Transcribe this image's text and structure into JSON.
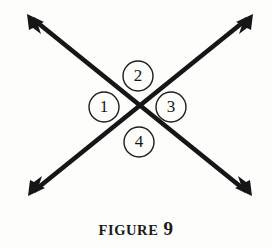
{
  "figure": {
    "caption_word": "FIGURE",
    "caption_number": "9",
    "background_color": "#fdfdfc",
    "ink_color": "#161616"
  },
  "diagram": {
    "intersection": {
      "x": 139,
      "y": 108
    },
    "lines": [
      {
        "name": "line-nw-se",
        "from": {
          "x": 27,
          "y": 14
        },
        "to": {
          "x": 252,
          "y": 196
        }
      },
      {
        "name": "line-sw-ne",
        "from": {
          "x": 28,
          "y": 196
        },
        "to": {
          "x": 253,
          "y": 14
        }
      }
    ],
    "arrowheads": [
      {
        "name": "arrowhead-top-left",
        "x": 27,
        "y": 14
      },
      {
        "name": "arrowhead-top-right",
        "x": 253,
        "y": 14
      },
      {
        "name": "arrowhead-bottom-left",
        "x": 28,
        "y": 196
      },
      {
        "name": "arrowhead-bottom-right",
        "x": 252,
        "y": 196
      }
    ],
    "angle_labels": [
      {
        "label": "1",
        "position": "left",
        "cx": 104,
        "cy": 107,
        "r": 15
      },
      {
        "label": "2",
        "position": "top",
        "cx": 138,
        "cy": 76,
        "r": 15
      },
      {
        "label": "3",
        "position": "right",
        "cx": 171,
        "cy": 107,
        "r": 15
      },
      {
        "label": "4",
        "position": "bottom",
        "cx": 139,
        "cy": 142,
        "r": 15
      }
    ]
  }
}
